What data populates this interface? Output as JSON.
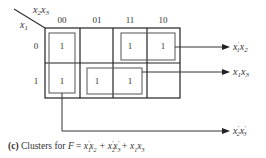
{
  "kmap": {
    "corner_top_label": "x2x3",
    "corner_left_label": "x1",
    "column_headers": [
      "00",
      "01",
      "11",
      "10"
    ],
    "row_headers": [
      "0",
      "1"
    ],
    "cells": [
      [
        "1",
        "",
        "1",
        "1"
      ],
      [
        "1",
        "1",
        "1",
        ""
      ]
    ]
  },
  "clusters": [
    {
      "term": "x1'x2",
      "cells": [
        [
          0,
          2
        ],
        [
          0,
          3
        ]
      ]
    },
    {
      "term": "x1x3",
      "cells": [
        [
          1,
          1
        ],
        [
          1,
          2
        ]
      ]
    },
    {
      "term": "x2'x3'",
      "cells": [
        [
          0,
          0
        ],
        [
          1,
          0
        ]
      ]
    }
  ],
  "caption": {
    "tag": "(c)",
    "text": "Clusters for",
    "formula_lhs": "F",
    "formula_rhs": "x1'x2 + x2'x3' + x1x3"
  }
}
